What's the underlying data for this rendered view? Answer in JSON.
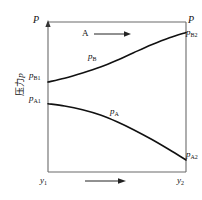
{
  "figure": {
    "kind": "pressure-profile-diagram",
    "background_color": "#ffffff",
    "line_color": "#111111",
    "axis_color": "#555555"
  },
  "axes": {
    "y_axis_label": "压力p",
    "y_axis_label_text": "压力",
    "y_axis_label_symbol": "p",
    "x_tick_left": "y",
    "x_tick_left_sub": "1",
    "x_tick_right": "y",
    "x_tick_right_sub": "2",
    "x_direction_arrow": "arrow-right",
    "y_top_arrow": "arrow-up"
  },
  "labels": {
    "total_pressure_left": "P",
    "total_pressure_right": "P",
    "pB2": "p",
    "pB2_sub": "B2",
    "pB1": "p",
    "pB1_sub": "B1",
    "pA1": "p",
    "pA1_sub": "A1",
    "pA2": "p",
    "pA2_sub": "A2",
    "curve_pB": "p",
    "curve_pB_sub": "B",
    "curve_pA": "p",
    "curve_pA_sub": "A",
    "stream_A": "A"
  },
  "chart_data": {
    "type": "line",
    "title": "",
    "xlabel": "",
    "ylabel": "压力p",
    "grid": false,
    "legend": "inline-curve-labels",
    "x": [
      "y1",
      "y2"
    ],
    "xlim": [
      0,
      1
    ],
    "ylim": [
      0,
      1
    ],
    "annotations": [
      {
        "text": "P",
        "position": "top-left",
        "meaning": "total pressure"
      },
      {
        "text": "P",
        "position": "top-right",
        "meaning": "total pressure"
      },
      {
        "text": "A",
        "position": "upper-middle",
        "meaning": "component A transfer direction"
      }
    ],
    "series": [
      {
        "name": "p_B",
        "label": "pB",
        "start_label": "pB1",
        "end_label": "pB2",
        "start_value": 0.6,
        "end_value": 0.93,
        "shape": "convex-increasing",
        "points": [
          [
            0.0,
            0.6
          ],
          [
            0.12,
            0.625
          ],
          [
            0.25,
            0.66
          ],
          [
            0.38,
            0.7
          ],
          [
            0.5,
            0.745
          ],
          [
            0.62,
            0.795
          ],
          [
            0.75,
            0.848
          ],
          [
            0.88,
            0.895
          ],
          [
            1.0,
            0.93
          ]
        ]
      },
      {
        "name": "p_A",
        "label": "pA",
        "start_label": "pA1",
        "end_label": "pA2",
        "start_value": 0.455,
        "end_value": 0.08,
        "shape": "concave-decreasing",
        "points": [
          [
            0.0,
            0.455
          ],
          [
            0.12,
            0.44
          ],
          [
            0.25,
            0.415
          ],
          [
            0.38,
            0.38
          ],
          [
            0.5,
            0.335
          ],
          [
            0.62,
            0.282
          ],
          [
            0.75,
            0.218
          ],
          [
            0.88,
            0.148
          ],
          [
            1.0,
            0.08
          ]
        ]
      }
    ]
  }
}
